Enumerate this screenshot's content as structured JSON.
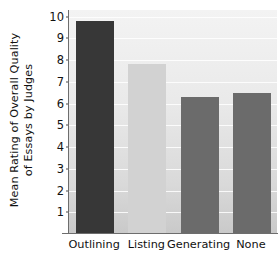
{
  "chart_data": {
    "type": "bar",
    "title": "",
    "xlabel": "",
    "ylabel": "Mean Rating of Overall Quality\nof Essays by Judges",
    "categories": [
      "Outlining",
      "Listing",
      "Generating",
      "None"
    ],
    "values": [
      9.8,
      7.8,
      6.3,
      6.5
    ],
    "ylim": [
      0,
      10.3
    ],
    "yticks": [
      1,
      2,
      3,
      4,
      5,
      6,
      7,
      8,
      9,
      10
    ],
    "ytick_labels": [
      "1",
      "2",
      "3",
      "4",
      "5",
      "6",
      "7",
      "8",
      "9",
      "10"
    ],
    "grid": true,
    "grid_axis": "y",
    "legend": false,
    "bar_colors": [
      "#373737",
      "#d2d2d2",
      "#6b6b6b",
      "#6b6b6b"
    ],
    "plot_background": "#e9e9e9",
    "axis_color": "#6d6d6d",
    "gridline_color": "#ffffff"
  }
}
